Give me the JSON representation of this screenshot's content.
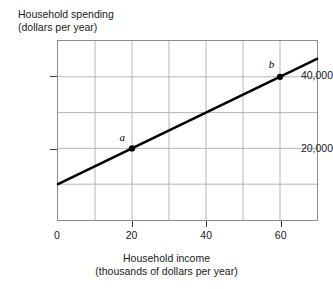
{
  "chart_data": {
    "type": "line",
    "title": "",
    "xlabel": "Household income",
    "xlabel_units": "(thousands of dollars per year)",
    "ylabel": "Household spending",
    "ylabel_units": "(dollars per year)",
    "xlim": [
      0,
      70
    ],
    "ylim": [
      0,
      50000
    ],
    "grid": true,
    "legend": "none",
    "x_ticks": [
      {
        "value": 0,
        "label": "0"
      },
      {
        "value": 20,
        "label": "20"
      },
      {
        "value": 40,
        "label": "40"
      },
      {
        "value": 60,
        "label": "60"
      }
    ],
    "y_ticks": [
      {
        "value": 20000,
        "label": "20,000"
      },
      {
        "value": 40000,
        "label": "40,000"
      }
    ],
    "x_gridlines": [
      10,
      20,
      30,
      40,
      50,
      60
    ],
    "y_gridlines": [
      10000,
      20000,
      30000,
      40000
    ],
    "series": [
      {
        "name": "spending line",
        "color": "#000000",
        "x": [
          0,
          70
        ],
        "values": [
          10000,
          45000
        ]
      }
    ],
    "annotations": [
      {
        "label": "a",
        "x": 20,
        "y": 20000,
        "marker": "dot"
      },
      {
        "label": "b",
        "x": 60,
        "y": 40000,
        "marker": "dot"
      }
    ],
    "colors": {
      "line": "#000000",
      "grid": "#b4b4b4",
      "frame": "#8d8d8d",
      "text": "#1a1a1a",
      "background": "#ffffff"
    }
  }
}
